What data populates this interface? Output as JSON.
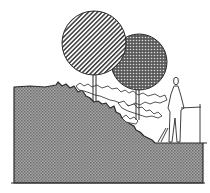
{
  "diagram": {
    "type": "landscape-section-sketch",
    "elements": [
      {
        "id": "ground",
        "label": "sloped ground mass",
        "fill": "#8c8c8c"
      },
      {
        "id": "tree-large",
        "label": "large tree, diagonal hatch canopy"
      },
      {
        "id": "tree-small",
        "label": "smaller tree, dotted dark canopy"
      },
      {
        "id": "shrubs",
        "label": "shrub layer along slope"
      },
      {
        "id": "person",
        "label": "standing human figure"
      },
      {
        "id": "railing",
        "label": "handrail"
      }
    ],
    "colors": {
      "ink": "#2a2a2a",
      "ground_fill": "#9a9a9a",
      "ground_dot": "#6a6a6a",
      "canopy_dark": "#4a4a4a",
      "paper": "#ffffff"
    }
  }
}
